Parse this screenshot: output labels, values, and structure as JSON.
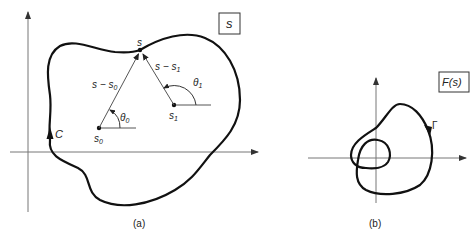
{
  "panel_a": {
    "caption": "(a)",
    "plane_label": "s",
    "contour_label": "C",
    "point_s": "s",
    "point_s0": "s",
    "point_s0_sub": "0",
    "point_s1": "s",
    "point_s1_sub": "1",
    "vector_s_s0": "s − s",
    "vector_s_s0_sub": "0",
    "vector_s_s1": "s − s",
    "vector_s_s1_sub": "1",
    "angle_theta0": "θ",
    "angle_theta0_sub": "0",
    "angle_theta1": "θ",
    "angle_theta1_sub": "1"
  },
  "panel_b": {
    "caption": "(b)",
    "plane_label": "F(s)",
    "contour_label": "Γ"
  },
  "colors": {
    "curve": "#111111",
    "axis": "#777777",
    "vector": "#555555"
  }
}
